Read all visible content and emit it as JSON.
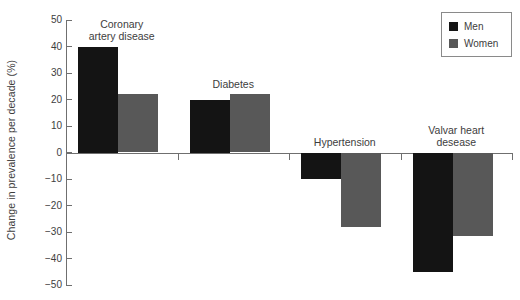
{
  "chart_data": {
    "type": "bar",
    "title": "",
    "xlabel": "",
    "ylabel": "Change in prevalence per decade (%)",
    "ylim": [
      -50,
      50
    ],
    "yticks": [
      50,
      40,
      30,
      20,
      10,
      0,
      -10,
      -20,
      -30,
      -40,
      -50
    ],
    "ytick_labels": [
      "50",
      "40",
      "30",
      "20",
      "10",
      "0",
      "−10",
      "−20",
      "−30",
      "−40",
      "−50"
    ],
    "grid": false,
    "legend_position": "top-right",
    "categories": [
      "Coronary\nartery disease",
      "Diabetes",
      "Hypertension",
      "Valvar heart\ndesease"
    ],
    "series": [
      {
        "name": "Men",
        "color": "#141414",
        "values": [
          40,
          20,
          -10,
          -45
        ]
      },
      {
        "name": "Women",
        "color": "#585858",
        "values": [
          22,
          22,
          -28,
          -31.5
        ]
      }
    ]
  },
  "legend": {
    "entries": [
      {
        "label": "Men",
        "swatch": "men"
      },
      {
        "label": "Women",
        "swatch": "women"
      }
    ]
  },
  "axis": {
    "y_title": "Change in prevalence per decade (%)"
  },
  "colors": {
    "men": "#141414",
    "women": "#585858",
    "axis": "#6f6f6f",
    "text": "#3d3d3d",
    "background": "#ffffff"
  }
}
